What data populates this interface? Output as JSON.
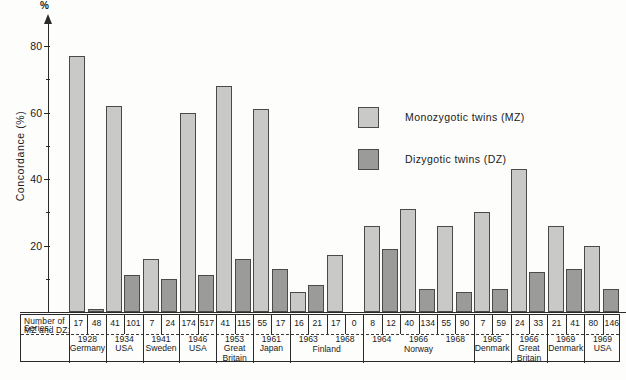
{
  "axis": {
    "unit_symbol": "%",
    "title": "Concordance  (%)",
    "ticks": [
      "80",
      "60",
      "40",
      "20"
    ],
    "ymin": 0,
    "ymax": 85
  },
  "legend": {
    "items": [
      {
        "key": "mz",
        "label": "Monozygotic  twins  (MZ)",
        "color": "#c9c9c7"
      },
      {
        "key": "dz",
        "label": "Dizygotic  twins       (DZ)",
        "color": "#9b9b99"
      }
    ]
  },
  "table": {
    "row_headers": {
      "counts": "Number of\nMZ and  DZ:",
      "series": "Series:"
    }
  },
  "caption": "",
  "chart_data": {
    "type": "bar",
    "title": "",
    "xlabel": "",
    "ylabel": "Concordance  (%)",
    "ylim": [
      0,
      85
    ],
    "grid": false,
    "legend_position": "center-right",
    "categories": [
      "1928 Germany",
      "1934 USA",
      "1941 Sweden",
      "1946 USA",
      "1953 Great Britain",
      "1961 Japan",
      "1963 Finland",
      "1968 Finland",
      "1964 Norway",
      "1966 Norway",
      "1968 Norway",
      "1965 Denmark",
      "1966 Great Britain",
      "1969 Denmark",
      "1969 USA"
    ],
    "series": [
      {
        "name": "Monozygotic twins (MZ)",
        "color": "#c9c9c7",
        "values": [
          77,
          62,
          16,
          60,
          68,
          61,
          6,
          17,
          26,
          31,
          26,
          30,
          43,
          26,
          20
        ]
      },
      {
        "name": "Dizygotic twins (DZ)",
        "color": "#9b9b99",
        "values": [
          1,
          11,
          10,
          11,
          16,
          13,
          8,
          0,
          19,
          7,
          6,
          7,
          12,
          13,
          7
        ]
      }
    ],
    "groups": [
      {
        "year": "1928",
        "country": "Germany",
        "n_mz": "17",
        "n_dz": "48",
        "mz": 77,
        "dz": 1
      },
      {
        "year": "1934",
        "country": "USA",
        "n_mz": "41",
        "n_dz": "101",
        "mz": 62,
        "dz": 11
      },
      {
        "year": "1941",
        "country": "Sweden",
        "n_mz": "7",
        "n_dz": "24",
        "mz": 16,
        "dz": 10
      },
      {
        "year": "1946",
        "country": "USA",
        "n_mz": "174",
        "n_dz": "517",
        "mz": 60,
        "dz": 11
      },
      {
        "year": "1953",
        "country": "Great\nBritain",
        "n_mz": "41",
        "n_dz": "115",
        "mz": 68,
        "dz": 16
      },
      {
        "year": "1961",
        "country": "Japan",
        "n_mz": "55",
        "n_dz": "17",
        "mz": 61,
        "dz": 13
      },
      {
        "year": "1963",
        "country": "Finland",
        "n_mz": "16",
        "n_dz": "21",
        "mz": 6,
        "dz": 8
      },
      {
        "year": "1968",
        "country": "Finland",
        "n_mz": "17",
        "n_dz": "0",
        "mz": 17,
        "dz": 0
      },
      {
        "year": "1964",
        "country": "Norway",
        "n_mz": "8",
        "n_dz": "12",
        "mz": 26,
        "dz": 19
      },
      {
        "year": "1966",
        "country": "Norway",
        "n_mz": "40",
        "n_dz": "134",
        "mz": 31,
        "dz": 7
      },
      {
        "year": "1968",
        "country": "Norway",
        "n_mz": "55",
        "n_dz": "90",
        "mz": 26,
        "dz": 6
      },
      {
        "year": "1965",
        "country": "Denmark",
        "n_mz": "7",
        "n_dz": "59",
        "mz": 30,
        "dz": 7
      },
      {
        "year": "1966",
        "country": "Great\nBritain",
        "n_mz": "24",
        "n_dz": "33",
        "mz": 43,
        "dz": 12
      },
      {
        "year": "1969",
        "country": "Denmark",
        "n_mz": "21",
        "n_dz": "41",
        "mz": 26,
        "dz": 13
      },
      {
        "year": "1969",
        "country": "USA",
        "n_mz": "80",
        "n_dz": "146",
        "mz": 20,
        "dz": 7
      }
    ],
    "country_spans": [
      {
        "label": "1928\nGermany",
        "from": 0,
        "to": 0
      },
      {
        "label": "1934\nUSA",
        "from": 1,
        "to": 1
      },
      {
        "label": "1941\nSweden",
        "from": 2,
        "to": 2
      },
      {
        "label": "1946\nUSA",
        "from": 3,
        "to": 3
      },
      {
        "label": "1953\nGreat\nBritain",
        "from": 4,
        "to": 4
      },
      {
        "label": "1961\nJapan",
        "from": 5,
        "to": 5
      },
      {
        "label": "1963",
        "from": 6,
        "to": 6
      },
      {
        "label": "1968",
        "from": 7,
        "to": 7
      },
      {
        "label": "Finland",
        "from": 6,
        "to": 7
      },
      {
        "label": "1964",
        "from": 8,
        "to": 8
      },
      {
        "label": "1966",
        "from": 9,
        "to": 9
      },
      {
        "label": "1968",
        "from": 10,
        "to": 10
      },
      {
        "label": "Norway",
        "from": 8,
        "to": 10
      },
      {
        "label": "1965\nDenmark",
        "from": 11,
        "to": 11
      },
      {
        "label": "1966\nGreat\nBritain",
        "from": 12,
        "to": 12
      },
      {
        "label": "1969\nDenmark",
        "from": 13,
        "to": 13
      },
      {
        "label": "1969\nUSA",
        "from": 14,
        "to": 14
      }
    ]
  }
}
